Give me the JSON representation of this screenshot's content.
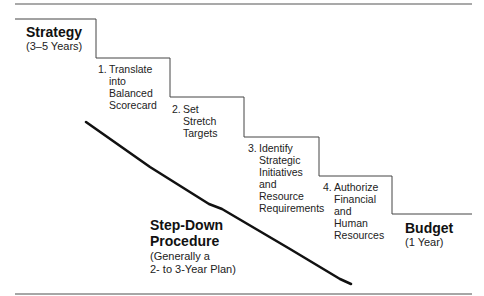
{
  "diagram": {
    "start": {
      "title": "Strategy",
      "subtitle": "(3–5 Years)"
    },
    "end": {
      "title": "Budget",
      "subtitle": "(1 Year)"
    },
    "procedure": {
      "title_line1": "Step-Down",
      "title_line2": "Procedure",
      "subtitle_line1": "(Generally a",
      "subtitle_line2": "2- to 3-Year Plan)"
    },
    "steps": [
      {
        "num": "1.",
        "lines": [
          "Translate",
          "into",
          "Balanced",
          "Scorecard"
        ]
      },
      {
        "num": "2.",
        "lines": [
          "Set",
          "Stretch",
          "Targets"
        ]
      },
      {
        "num": "3.",
        "lines": [
          "Identify",
          "Strategic",
          "Initiatives",
          "and",
          "Resource",
          "Requirements"
        ]
      },
      {
        "num": "4.",
        "lines": [
          "Authorize",
          "Financial",
          "and",
          "Human",
          "Resources"
        ]
      }
    ],
    "colors": {
      "line": "#333333",
      "rule": "#555555",
      "text": "#222222"
    }
  }
}
